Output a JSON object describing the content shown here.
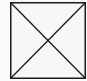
{
  "placeholder": {
    "icon": "image-placeholder-x-icon",
    "stroke_color": "#1a1a1a",
    "background_color": "#f7f7f7",
    "page_background": "#fbfbfb"
  }
}
